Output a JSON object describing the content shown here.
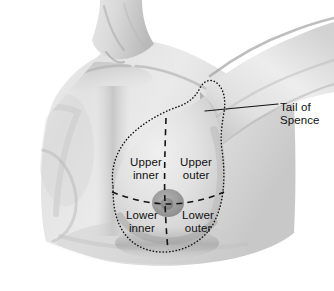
{
  "figure": {
    "background_color": "#ffffff",
    "ink_color": "#101010"
  },
  "annotations": {
    "callout": {
      "name": "tail-of-spence",
      "line1": "Tail of",
      "line2": "Spence",
      "leader_line": true
    },
    "quadrants": [
      {
        "id": "upper-inner",
        "line1": "Upper",
        "line2": "inner"
      },
      {
        "id": "upper-outer",
        "line1": "Upper",
        "line2": "outer"
      },
      {
        "id": "lower-inner",
        "line1": "Lower",
        "line2": "inner"
      },
      {
        "id": "lower-outer",
        "line1": "Lower",
        "line2": "outer"
      }
    ]
  },
  "guides": {
    "breast_outline_style": "dotted",
    "quadrant_divider_style": "dashed"
  }
}
